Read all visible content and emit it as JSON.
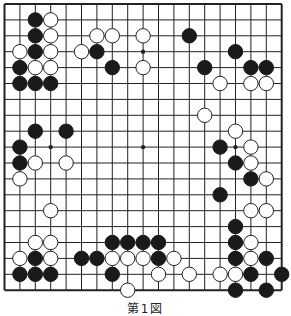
{
  "diagram": {
    "type": "go-board",
    "size": 19,
    "caption": "第1図",
    "colors": {
      "line": "#222222",
      "black_stone": "#1a1a1a",
      "white_stone": "#ffffff",
      "background": "#ffffff"
    },
    "hoshi": [
      [
        3,
        3
      ],
      [
        9,
        3
      ],
      [
        15,
        3
      ],
      [
        3,
        9
      ],
      [
        9,
        9
      ],
      [
        15,
        9
      ],
      [
        3,
        15
      ],
      [
        9,
        15
      ],
      [
        15,
        15
      ]
    ],
    "stones": {
      "black": [
        [
          2,
          1
        ],
        [
          2,
          2
        ],
        [
          2,
          3
        ],
        [
          1,
          4
        ],
        [
          1,
          5
        ],
        [
          2,
          5
        ],
        [
          3,
          5
        ],
        [
          6,
          3
        ],
        [
          7,
          4
        ],
        [
          12,
          2
        ],
        [
          15,
          3
        ],
        [
          13,
          4
        ],
        [
          16,
          4
        ],
        [
          17,
          4
        ],
        [
          2,
          8
        ],
        [
          4,
          8
        ],
        [
          1,
          9
        ],
        [
          1,
          10
        ],
        [
          14,
          9
        ],
        [
          15,
          10
        ],
        [
          16,
          11
        ],
        [
          14,
          12
        ],
        [
          15,
          14
        ],
        [
          15,
          15
        ],
        [
          15,
          16
        ],
        [
          17,
          16
        ],
        [
          16,
          17
        ],
        [
          18,
          17
        ],
        [
          15,
          18
        ],
        [
          17,
          18
        ],
        [
          7,
          15
        ],
        [
          8,
          15
        ],
        [
          9,
          15
        ],
        [
          10,
          15
        ],
        [
          5,
          16
        ],
        [
          6,
          16
        ],
        [
          10,
          16
        ],
        [
          2,
          16
        ],
        [
          1,
          17
        ],
        [
          2,
          17
        ],
        [
          3,
          17
        ],
        [
          7,
          17
        ]
      ],
      "white": [
        [
          3,
          1
        ],
        [
          3,
          2
        ],
        [
          3,
          3
        ],
        [
          1,
          3
        ],
        [
          2,
          4
        ],
        [
          3,
          4
        ],
        [
          6,
          2
        ],
        [
          7,
          2
        ],
        [
          9,
          2
        ],
        [
          5,
          3
        ],
        [
          9,
          4
        ],
        [
          14,
          5
        ],
        [
          16,
          5
        ],
        [
          17,
          5
        ],
        [
          13,
          7
        ],
        [
          15,
          8
        ],
        [
          16,
          9
        ],
        [
          16,
          10
        ],
        [
          17,
          11
        ],
        [
          2,
          10
        ],
        [
          4,
          10
        ],
        [
          1,
          11
        ],
        [
          3,
          13
        ],
        [
          16,
          13
        ],
        [
          17,
          13
        ],
        [
          16,
          15
        ],
        [
          16,
          16
        ],
        [
          12,
          17
        ],
        [
          14,
          17
        ],
        [
          15,
          17
        ],
        [
          2,
          15
        ],
        [
          3,
          15
        ],
        [
          1,
          16
        ],
        [
          3,
          16
        ],
        [
          7,
          16
        ],
        [
          8,
          16
        ],
        [
          9,
          16
        ],
        [
          11,
          16
        ],
        [
          10,
          17
        ],
        [
          8,
          18
        ]
      ]
    }
  }
}
